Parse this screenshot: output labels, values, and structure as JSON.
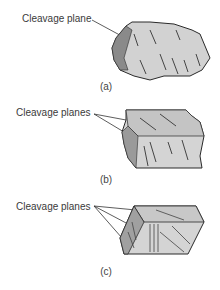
{
  "figures": [
    {
      "id": "a",
      "callout": "Cleavage plane",
      "caption": "(a)",
      "description": "Irregular mineral fragment with one cleavage plane"
    },
    {
      "id": "b",
      "callout": "Cleavage planes",
      "caption": "(b)",
      "description": "Blocky mineral fragment with two cleavage planes"
    },
    {
      "id": "c",
      "callout": "Cleavage planes",
      "caption": "(c)",
      "description": "Prismatic block with three cleavage planes"
    }
  ],
  "colors": {
    "face_light": "#d8d8d8",
    "face_mid": "#b8b8b8",
    "face_dark": "#7a7a7a",
    "outline": "#2a2a2a",
    "hatch": "#333333"
  }
}
